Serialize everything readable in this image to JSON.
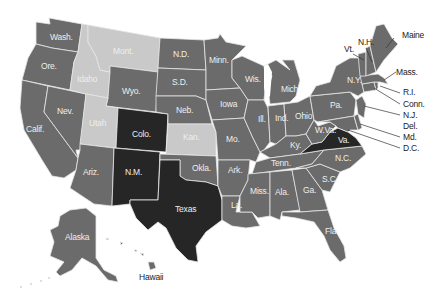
{
  "colors": {
    "medium": "#6b6b6b",
    "light": "#c9c9c9",
    "dark": "#262626",
    "border": "#e6e6e6",
    "label_inside": "#eeeeee",
    "label_outside": "#222222",
    "background": "#ffffff"
  },
  "legend_categories": [
    "light",
    "medium",
    "dark"
  ],
  "states": {
    "WA": {
      "label": "Wash.",
      "shade": "medium"
    },
    "OR": {
      "label": "Ore.",
      "shade": "medium"
    },
    "CA": {
      "label": "Calif.",
      "shade": "medium"
    },
    "NV": {
      "label": "Nev.",
      "shade": "medium"
    },
    "ID": {
      "label": "Idaho",
      "shade": "light"
    },
    "MT": {
      "label": "Mont.",
      "shade": "light"
    },
    "WY": {
      "label": "Wyo.",
      "shade": "medium"
    },
    "UT": {
      "label": "Utah",
      "shade": "light"
    },
    "CO": {
      "label": "Colo.",
      "shade": "dark"
    },
    "AZ": {
      "label": "Ariz.",
      "shade": "medium"
    },
    "NM": {
      "label": "N.M.",
      "shade": "dark"
    },
    "ND": {
      "label": "N.D.",
      "shade": "medium"
    },
    "SD": {
      "label": "S.D.",
      "shade": "medium"
    },
    "NE": {
      "label": "Neb.",
      "shade": "medium"
    },
    "KS": {
      "label": "Kan.",
      "shade": "light"
    },
    "OK": {
      "label": "Okla.",
      "shade": "medium"
    },
    "TX": {
      "label": "Texas",
      "shade": "dark"
    },
    "MN": {
      "label": "Minn.",
      "shade": "medium"
    },
    "IA": {
      "label": "Iowa",
      "shade": "medium"
    },
    "MO": {
      "label": "Mo.",
      "shade": "medium"
    },
    "AR": {
      "label": "Ark.",
      "shade": "medium"
    },
    "LA": {
      "label": "La.",
      "shade": "medium"
    },
    "WI": {
      "label": "Wis.",
      "shade": "medium"
    },
    "IL": {
      "label": "Ill.",
      "shade": "medium"
    },
    "MI": {
      "label": "Mich.",
      "shade": "medium"
    },
    "IN": {
      "label": "Ind.",
      "shade": "medium"
    },
    "OH": {
      "label": "Ohio",
      "shade": "medium"
    },
    "KY": {
      "label": "Ky.",
      "shade": "medium"
    },
    "TN": {
      "label": "Tenn.",
      "shade": "medium"
    },
    "MS": {
      "label": "Miss.",
      "shade": "medium"
    },
    "AL": {
      "label": "Ala.",
      "shade": "medium"
    },
    "GA": {
      "label": "Ga.",
      "shade": "medium"
    },
    "FL": {
      "label": "Fla.",
      "shade": "medium"
    },
    "SC": {
      "label": "S.C.",
      "shade": "medium"
    },
    "NC": {
      "label": "N.C.",
      "shade": "medium"
    },
    "VA": {
      "label": "Va.",
      "shade": "dark"
    },
    "WV": {
      "label": "W.Va.",
      "shade": "medium"
    },
    "PA": {
      "label": "Pa.",
      "shade": "medium"
    },
    "NY": {
      "label": "N.Y.",
      "shade": "medium"
    },
    "VT": {
      "label": "Vt.",
      "shade": "medium"
    },
    "NH": {
      "label": "N.H.",
      "shade": "medium"
    },
    "ME": {
      "label": "Maine",
      "shade": "medium"
    },
    "MA": {
      "label": "Mass.",
      "shade": "medium"
    },
    "RI": {
      "label": "R.I.",
      "shade": "medium"
    },
    "CT": {
      "label": "Conn.",
      "shade": "medium"
    },
    "NJ": {
      "label": "N.J.",
      "shade": "medium"
    },
    "DE": {
      "label": "Del.",
      "shade": "medium"
    },
    "MD": {
      "label": "Md.",
      "shade": "medium"
    },
    "DC": {
      "label": "D.C.",
      "shade": "medium"
    },
    "AK": {
      "label": "Alaska",
      "shade": "medium"
    },
    "HI": {
      "label": "Hawaii",
      "shade": "medium"
    }
  }
}
